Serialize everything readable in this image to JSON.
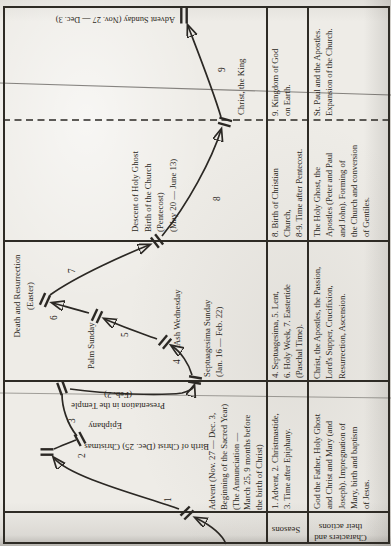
{
  "paper": {
    "background": "#eeece7",
    "ink": "#2a2620",
    "rule_color": "#2e2b25"
  },
  "table": {
    "row_headers": {
      "seasons": "Seasons",
      "characters": "Characters and\ntheir actions"
    },
    "seasons_cells": [
      "1. Advent, 2. Christmastide,\n3. Time after Epiphany.",
      "4. Septuagesima, 5. Lent,\n6. Holy Week, 7. Eastertide\n(Paschal Time).",
      "8. Birth of Christian\nChurch,\n8-9. Time after Pentecost.",
      "9. Kingdom of God\non Earth."
    ],
    "characters_cells": [
      "God the Father, Holy Ghost\nand Christ and Mary (and\nJoseph). Impregnation of\nMary, birth and baptism\nof Jesus.",
      "Christ, the Apostles, the Passion,\nLord's Supper, Crucifixion,\nResurrection, Ascension.",
      "The Holy Ghost, the\nApostles (Peter and Paul\nand John). Forming of\nthe Church and conversion\nof Gentiles.",
      "St. Paul and the Apostles.\nExpansion of the Church."
    ]
  },
  "timeline": {
    "advent_note": "Advent (Nov. 27 — Dec. 3,\nBeginning of the Sacred Year)\n(The Annunciation —\nMarch 25, 9 months before\nthe birth of Christ)",
    "labels": {
      "christmas": "Birth of Christ (Dec. 25) Christmas",
      "epiphany": "Epiphany",
      "presentation": "Presentation in the Temple\n(Feb. 2)",
      "septuagesima": "Septuagesima Sunday\n(Jan. 16 — Feb. 22)",
      "ash_wednesday": "Ash Wednesday",
      "palm_sunday": "Palm Sunday",
      "easter": "Death and Resurrection\n(Easter)",
      "pentecost": "Descent of Holy Ghost\nBirth of the Church\n(Pentecost)\n(May 20 — June 13)",
      "christ_king": "Christ, the King",
      "advent_sunday": "Advent Sunday (Nov. 27 — Dec. 3)"
    },
    "segment_numbers": [
      "1",
      "2",
      "3",
      "4",
      "5",
      "6",
      "7",
      "8",
      "9"
    ]
  }
}
